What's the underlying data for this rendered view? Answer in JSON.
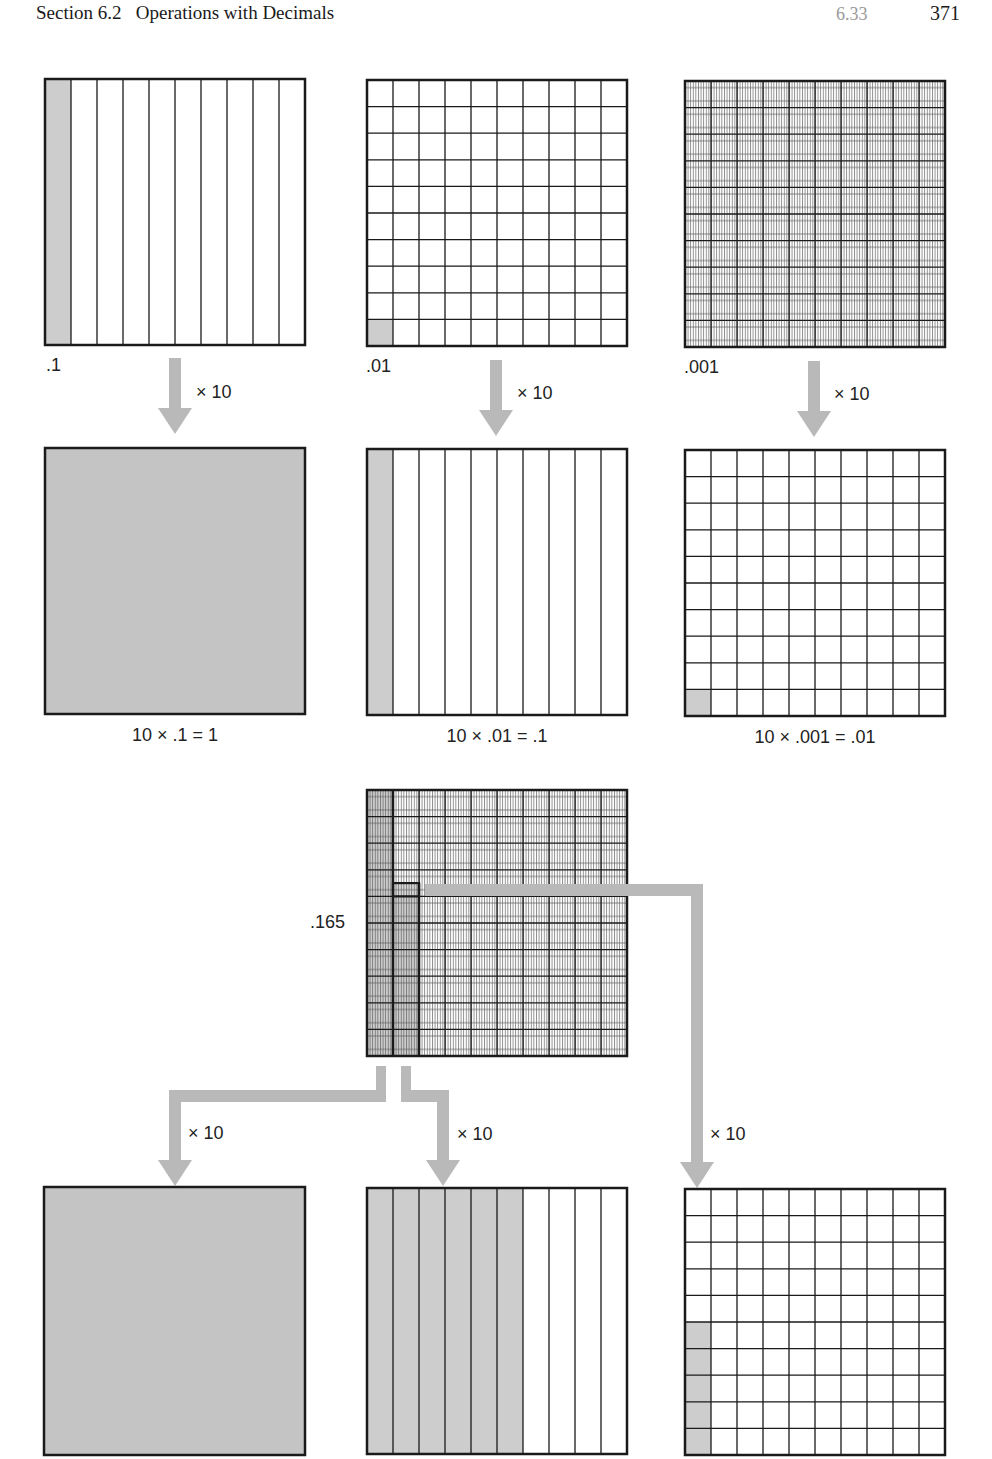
{
  "header": {
    "section": "Section 6.2",
    "title": "Operations with Decimals",
    "sub_page": "6.33",
    "page_number": "371"
  },
  "colors": {
    "shade": "#c9c9c9",
    "shade_dark": "#bdbdbd",
    "arrow": "#b8b8b8",
    "line": "#1a1a1a"
  },
  "row1": {
    "grids": [
      {
        "label": ".1",
        "type": "tenths",
        "shaded": "1 column"
      },
      {
        "label": ".01",
        "type": "hundredths",
        "shaded": "1 cell"
      },
      {
        "label": ".001",
        "type": "thousandths",
        "shaded": "none visible"
      }
    ],
    "arrow_label": "× 10"
  },
  "row2": {
    "grids": [
      {
        "caption": "10 × .1 = 1",
        "type": "whole",
        "shaded": "full"
      },
      {
        "caption": "10 × .01 = .1",
        "type": "tenths",
        "shaded": "1 column"
      },
      {
        "caption": "10 × .001 = .01",
        "type": "hundredths",
        "shaded": "1 cell"
      }
    ]
  },
  "middle": {
    "label": ".165",
    "type": "thousandths",
    "shaded": "1 tenth column + 6 hundredths + 5 thousandths"
  },
  "row3": {
    "arrow_labels": [
      "× 10",
      "× 10",
      "× 10"
    ],
    "grids": [
      {
        "type": "whole",
        "shaded": "full"
      },
      {
        "type": "tenths",
        "shaded": "6 columns"
      },
      {
        "type": "hundredths",
        "shaded": "5 cells"
      }
    ]
  }
}
